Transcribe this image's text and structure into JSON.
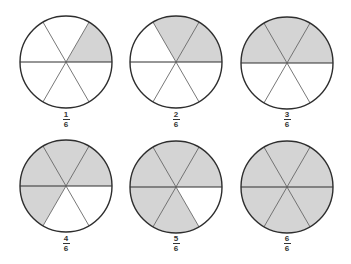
{
  "colors": {
    "shade": "#d4d4d4",
    "outline": "#2e2e2e",
    "divider": "#555555"
  },
  "circles": [
    {
      "cx": 66,
      "cy": 62,
      "r": 46,
      "shaded": 1,
      "numerator": "1",
      "denominator": "6"
    },
    {
      "cx": 176,
      "cy": 62,
      "r": 46,
      "shaded": 2,
      "numerator": "2",
      "denominator": "6"
    },
    {
      "cx": 287,
      "cy": 63,
      "r": 46,
      "shaded": 3,
      "numerator": "3",
      "denominator": "6"
    },
    {
      "cx": 66,
      "cy": 186,
      "r": 46,
      "shaded": 4,
      "numerator": "4",
      "denominator": "6"
    },
    {
      "cx": 176,
      "cy": 187,
      "r": 46,
      "shaded": 5,
      "numerator": "5",
      "denominator": "6"
    },
    {
      "cx": 287,
      "cy": 187,
      "r": 46,
      "shaded": 6,
      "numerator": "6",
      "denominator": "6"
    }
  ]
}
